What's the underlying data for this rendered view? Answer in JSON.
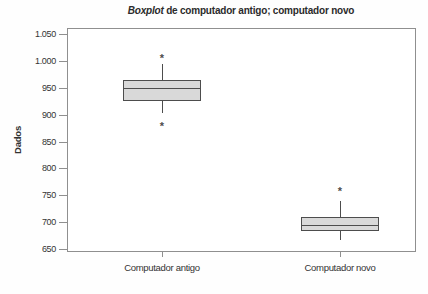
{
  "title": {
    "italic_word": "Boxplot",
    "rest": " de computador antigo; computador novo"
  },
  "colors": {
    "box_fill": "#d9d9d9",
    "box_border": "#4d4d4d",
    "frame": "#8f8f8f",
    "text": "#333333"
  },
  "chart_data": {
    "type": "boxplot",
    "title": "Boxplot de computador antigo; computador novo",
    "ylabel": "Dados",
    "xlabel": "",
    "ylim": [
      650,
      1050
    ],
    "yticks": [
      1050,
      1000,
      950,
      900,
      850,
      800,
      750,
      700,
      650
    ],
    "ytick_labels": [
      "1.050",
      "1.000",
      "950",
      "900",
      "850",
      "800",
      "750",
      "700",
      "650"
    ],
    "categories": [
      "Computador antigo",
      "Computador novo"
    ],
    "grid": false,
    "legend": false,
    "series": [
      {
        "name": "Computador antigo",
        "whisker_low": 903,
        "q1": 926,
        "median": 949,
        "q3": 964,
        "whisker_high": 994,
        "outliers": [
          880,
          1008
        ]
      },
      {
        "name": "Computador novo",
        "whisker_low": 667,
        "q1": 683,
        "median": 695,
        "q3": 710,
        "whisker_high": 740,
        "outliers": [
          759
        ]
      }
    ]
  }
}
